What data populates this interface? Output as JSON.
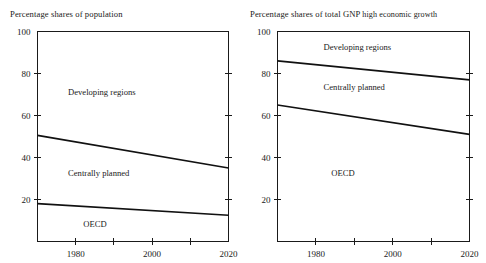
{
  "figure": {
    "background": "#ffffff",
    "line_color": "#111111",
    "text_color": "#1a1a1a"
  },
  "chart_data": [
    {
      "type": "line",
      "panel": "left",
      "title": "Percentage shares of population",
      "title_main": "Percentage shares of population",
      "title_sub": "",
      "xlabel": "",
      "ylabel": "",
      "xlim": [
        1970,
        2020
      ],
      "ylim": [
        0,
        100
      ],
      "yticks": [
        20,
        40,
        60,
        80,
        100
      ],
      "ytick_labels": [
        "20",
        "40",
        "60",
        "80",
        "100"
      ],
      "xticks": [
        1980,
        1990,
        2000,
        2010,
        2020
      ],
      "xtick_labels": [
        "1980",
        "",
        "2000",
        "",
        "2020"
      ],
      "grid": false,
      "legend": "in-plot annotations",
      "x": [
        1970,
        2020
      ],
      "series": [
        {
          "name": "Developing regions boundary (top of Centrally planned)",
          "values": [
            50.5,
            35.0
          ]
        },
        {
          "name": "OECD boundary (top of OECD)",
          "values": [
            18.0,
            12.5
          ]
        }
      ],
      "annotations": [
        {
          "text": "Developing regions",
          "x": 1978,
          "y": 70
        },
        {
          "text": "Centrally planned",
          "x": 1978,
          "y": 31
        },
        {
          "text": "OECD",
          "x": 1982,
          "y": 7
        }
      ],
      "bands": [
        {
          "label": "Developing regions",
          "from_1970": 49.5,
          "from_2020": 65.0
        },
        {
          "label": "Centrally planned",
          "from_1970": 32.5,
          "from_2020": 22.5
        },
        {
          "label": "OECD",
          "from_1970": 18.0,
          "from_2020": 12.5
        }
      ]
    },
    {
      "type": "line",
      "panel": "right",
      "title": "Percentage shares of total GNP high economic growth",
      "title_main": "Percentage shares of total GNP",
      "title_sub": "high economic growth",
      "xlabel": "",
      "ylabel": "",
      "xlim": [
        1970,
        2020
      ],
      "ylim": [
        0,
        100
      ],
      "yticks": [
        20,
        40,
        60,
        80,
        100
      ],
      "ytick_labels": [
        "20",
        "40",
        "60",
        "80",
        "100"
      ],
      "xticks": [
        1980,
        1990,
        2000,
        2010,
        2020
      ],
      "xtick_labels": [
        "1980",
        "",
        "2000",
        "",
        "2020"
      ],
      "grid": false,
      "legend": "in-plot annotations",
      "x": [
        1970,
        2020
      ],
      "series": [
        {
          "name": "Developing regions boundary (top of Centrally planned)",
          "values": [
            86.0,
            77.0
          ]
        },
        {
          "name": "OECD boundary (top of OECD)",
          "values": [
            65.0,
            51.0
          ]
        }
      ],
      "annotations": [
        {
          "text": "Developing regions",
          "x": 1982,
          "y": 91
        },
        {
          "text": "Centrally planned",
          "x": 1982,
          "y": 72
        },
        {
          "text": "OECD",
          "x": 1984,
          "y": 31
        }
      ],
      "bands": [
        {
          "label": "Developing regions",
          "from_1970": 14.0,
          "from_2020": 23.0
        },
        {
          "label": "Centrally planned",
          "from_1970": 21.0,
          "from_2020": 26.0
        },
        {
          "label": "OECD",
          "from_1970": 65.0,
          "from_2020": 51.0
        }
      ]
    }
  ]
}
